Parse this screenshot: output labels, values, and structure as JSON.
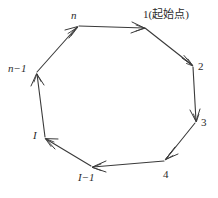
{
  "figure": {
    "type": "cycle-diagram",
    "shape": "heptagon",
    "stroke_color": "#3a3a3a",
    "background_color": "#ffffff",
    "direction": "clockwise"
  },
  "vertices": [
    {
      "id": "v1",
      "label": "1(起始点)",
      "x": 145,
      "y": 28,
      "label_x": 143,
      "label_y": 9,
      "italic": false
    },
    {
      "id": "v2",
      "label": "2",
      "x": 193,
      "y": 66,
      "label_x": 198,
      "label_y": 61,
      "italic": false
    },
    {
      "id": "v3",
      "label": "3",
      "x": 196,
      "y": 122,
      "label_x": 201,
      "label_y": 117,
      "italic": false
    },
    {
      "id": "v4",
      "label": "4",
      "x": 165,
      "y": 160,
      "label_x": 163,
      "label_y": 169,
      "italic": false
    },
    {
      "id": "vi1",
      "label": "I−1",
      "x": 92,
      "y": 167,
      "label_x": 78,
      "label_y": 172,
      "italic": true
    },
    {
      "id": "vi",
      "label": "I",
      "x": 45,
      "y": 138,
      "label_x": 33,
      "label_y": 130,
      "italic": true
    },
    {
      "id": "vn1",
      "label": "n−1",
      "x": 36,
      "y": 73,
      "label_x": 8,
      "label_y": 63,
      "italic": true
    },
    {
      "id": "vn",
      "label": "n",
      "x": 78,
      "y": 26,
      "label_x": 71,
      "label_y": 10,
      "italic": true
    }
  ],
  "edges": [
    {
      "id": "e1",
      "from": "v1",
      "to": "v2",
      "arrow_at": "v2"
    },
    {
      "id": "e2",
      "from": "v2",
      "to": "v3",
      "arrow_at": "v3"
    },
    {
      "id": "e3",
      "from": "v3",
      "to": "v4",
      "arrow_at": "v4"
    },
    {
      "id": "e4",
      "from": "v4",
      "to": "vi1",
      "arrow_at": "vi1"
    },
    {
      "id": "e5",
      "from": "vi1",
      "to": "vi",
      "arrow_at": "vi"
    },
    {
      "id": "e6",
      "from": "vi",
      "to": "vn1",
      "arrow_at": "vn1"
    },
    {
      "id": "e7",
      "from": "vn1",
      "to": "vn",
      "arrow_at": "vn"
    },
    {
      "id": "e8",
      "from": "vn",
      "to": "v1",
      "arrow_at": "v1"
    }
  ],
  "labels": {
    "start_node": "1(起始点)",
    "node_2": "2",
    "node_3": "3",
    "node_4": "4",
    "node_i_minus_1": "I−1",
    "node_i": "I",
    "node_n_minus_1": "n−1",
    "node_n": "n"
  }
}
